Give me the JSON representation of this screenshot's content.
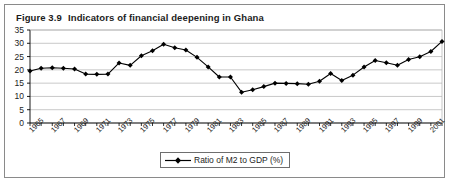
{
  "figure": {
    "number": "Figure 3.9",
    "title": "Indicators of financial deepening in Ghana"
  },
  "legend": {
    "position": "bottom-center",
    "entries": [
      {
        "label": "Ratio of M2 to GDP (%)",
        "marker": "diamond",
        "color": "#000000"
      }
    ]
  },
  "colors": {
    "series": "#000000",
    "gridline": "#b0b0b0",
    "axis": "#000000",
    "frame": "#8a8a8a",
    "text": "#1c1c1c",
    "background": "#ffffff"
  },
  "chart_data": {
    "type": "line",
    "title": "Indicators of financial deepening in Ghana",
    "xlabel": "",
    "ylabel": "",
    "ylim": [
      0,
      35
    ],
    "ytick_step": 5,
    "yticks": [
      0,
      5,
      10,
      15,
      20,
      25,
      30,
      35
    ],
    "xlim": [
      1965,
      2002
    ],
    "xtick_step": 2,
    "xticks": [
      1965,
      1967,
      1969,
      1971,
      1973,
      1975,
      1977,
      1979,
      1981,
      1983,
      1985,
      1987,
      1989,
      1991,
      1993,
      1995,
      1997,
      1999,
      2001
    ],
    "grid": true,
    "grid_axis": "y",
    "x": [
      1965,
      1966,
      1967,
      1968,
      1969,
      1970,
      1971,
      1972,
      1973,
      1974,
      1975,
      1976,
      1977,
      1978,
      1979,
      1980,
      1981,
      1982,
      1983,
      1984,
      1985,
      1986,
      1987,
      1988,
      1989,
      1990,
      1991,
      1992,
      1993,
      1994,
      1995,
      1996,
      1997,
      1998,
      1999,
      2000,
      2001,
      2002
    ],
    "series": [
      {
        "name": "Ratio of M2 to GDP (%)",
        "marker": "diamond",
        "color": "#000000",
        "values": [
          19.6,
          20.6,
          20.8,
          20.6,
          20.3,
          18.4,
          18.3,
          18.4,
          22.6,
          21.7,
          25.3,
          27.2,
          29.6,
          28.3,
          27.5,
          24.7,
          21.1,
          17.3,
          17.3,
          11.6,
          12.5,
          13.7,
          15.0,
          14.9,
          14.8,
          14.6,
          15.7,
          18.6,
          16.0,
          18.0,
          21.1,
          23.5,
          22.7,
          21.7,
          23.9,
          24.9,
          26.9,
          30.7
        ]
      }
    ]
  }
}
